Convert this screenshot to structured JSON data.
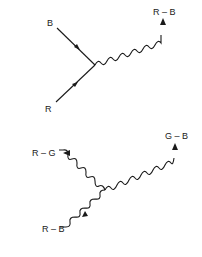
{
  "diagram_top": {
    "labels": {
      "in_1": "B",
      "in_2": "R",
      "out": "R – B"
    }
  },
  "diagram_bottom": {
    "labels": {
      "left_top": "R – G",
      "right_top": "G – B",
      "left_bottom": "R – B"
    }
  },
  "colors": {
    "ink": "#1a1a1a",
    "background": "#ffffff"
  }
}
